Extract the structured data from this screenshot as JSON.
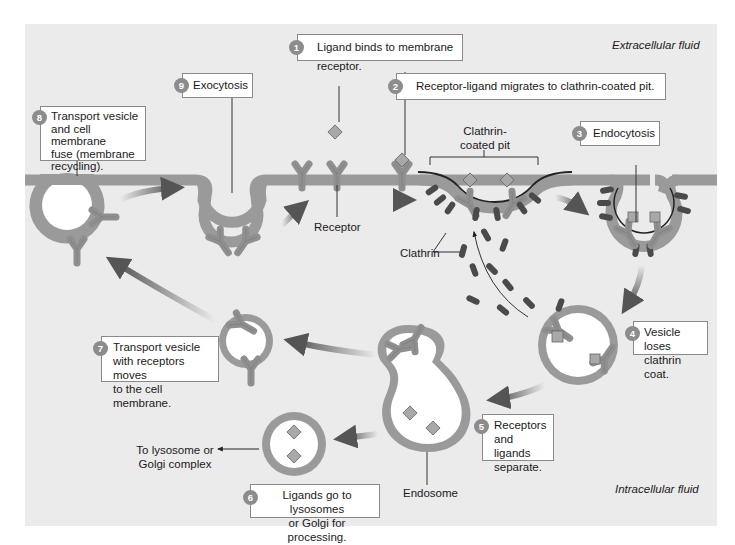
{
  "figure": {
    "regions": {
      "extracellular": "Extracellular fluid",
      "intracellular": "Intracellular fluid"
    },
    "colors": {
      "background": "#ebebeb",
      "membrane": "#9a9a9a",
      "membrane_edge": "#6e6e6e",
      "receptor": "#8f8f8f",
      "clathrin": "#4a4a4a",
      "badge": "#8c8c8c",
      "vesicle_lumen": "#ffffff"
    },
    "steps": [
      {
        "number": "1",
        "text": "Ligand binds to membrane receptor."
      },
      {
        "number": "2",
        "text": "Receptor-ligand migrates to clathrin-coated pit."
      },
      {
        "number": "3",
        "text": "Endocytosis"
      },
      {
        "number": "4",
        "text_lines": [
          "Vesicle loses",
          "clathrin coat."
        ]
      },
      {
        "number": "5",
        "text_lines": [
          "Receptors",
          "and ligands",
          "separate."
        ]
      },
      {
        "number": "6",
        "text_lines": [
          "Ligands go to lysosomes",
          "or Golgi for processing."
        ]
      },
      {
        "number": "7",
        "text_lines": [
          "Transport vesicle",
          "with receptors moves",
          "to the cell membrane."
        ]
      },
      {
        "number": "8",
        "text_lines": [
          "Transport vesicle",
          "and cell membrane",
          "fuse (membrane",
          "recycling)."
        ]
      },
      {
        "number": "9",
        "text": "Exocytosis"
      }
    ],
    "labels": {
      "receptor": "Receptor",
      "clathrin_pit_line1": "Clathrin-",
      "clathrin_pit_line2": "coated pit",
      "clathrin": "Clathrin",
      "endosome": "Endosome",
      "lysosome_line1": "To lysosome or",
      "lysosome_line2": "Golgi complex"
    }
  }
}
